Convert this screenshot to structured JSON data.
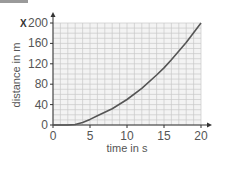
{
  "chart_data": {
    "type": "line",
    "title": "",
    "corner_label": "X",
    "xlabel": "time in s",
    "ylabel": "distance in m",
    "xlim": [
      0,
      20
    ],
    "ylim": [
      0,
      200
    ],
    "xticks": [
      0,
      5,
      10,
      15,
      20
    ],
    "yticks": [
      0,
      40,
      80,
      120,
      160,
      200
    ],
    "grid": true,
    "legend": null,
    "series": [
      {
        "name": "distance",
        "x": [
          0,
          2,
          3,
          4,
          5,
          6,
          8,
          10,
          12,
          14,
          15,
          16,
          18,
          20
        ],
        "y": [
          0,
          0,
          1,
          5,
          11,
          18,
          32,
          50,
          72,
          98,
          112,
          128,
          162,
          200
        ]
      }
    ]
  },
  "colors": {
    "curve": "#555555",
    "grid": "#c8c8c8",
    "axis": "#333333"
  }
}
